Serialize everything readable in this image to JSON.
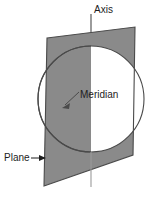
{
  "figure": {
    "background_color": "#ffffff",
    "width": 163,
    "height": 197,
    "labels": {
      "axis": "Axis",
      "meridian": "Meridian",
      "plane": "Plane"
    },
    "colors": {
      "plane_fill": "#8a8a8a",
      "outline": "#4a4a4a",
      "sphere_fill": "#ffffff",
      "text": "#1d1d1d",
      "leader_line": "#4a4a4a"
    },
    "geometry": {
      "plane_quad": "47,38 135,27 133,155 44,186",
      "sphere": {
        "cx": 91,
        "cy": 99,
        "r": 53
      },
      "axis_line": {
        "x": 91,
        "y1": 14,
        "y2": 187
      },
      "meridian_leader": {
        "x1": 78,
        "y1": 93,
        "x2": 63,
        "y2": 107
      },
      "plane_arrow": {
        "x1": 31,
        "y1": 158,
        "x2": 46,
        "y2": 158
      }
    },
    "elements": {
      "axis_name": "vertical-axis-line",
      "sphere_name": "sphere-outline",
      "plane_name": "meridian-plane",
      "meridian_arc_name": "meridian-arc"
    }
  }
}
